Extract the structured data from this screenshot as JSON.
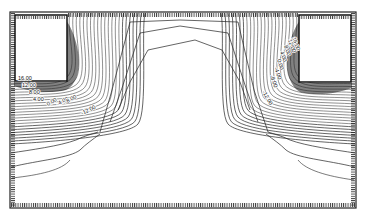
{
  "figure": {
    "type": "contour-plot",
    "frame": {
      "x": 10,
      "y": 12,
      "width": 346,
      "height": 196
    },
    "line_color": "#222222",
    "background": "#ffffff"
  },
  "electrodes": [
    {
      "name": "left-electrode",
      "x": 15,
      "y": 15,
      "width": 52,
      "height": 66
    },
    {
      "name": "right-electrode",
      "x": 299,
      "y": 15,
      "width": 52,
      "height": 67
    }
  ],
  "contour_labels": {
    "left": [
      {
        "text": "16.00",
        "x": 18,
        "y": 80,
        "rotate": 0
      },
      {
        "text": "12.00",
        "x": 22,
        "y": 87,
        "rotate": 0
      },
      {
        "text": "8.00",
        "x": 29,
        "y": 94,
        "rotate": 0
      },
      {
        "text": "4.00",
        "x": 33,
        "y": 101,
        "rotate": 0
      },
      {
        "text": "0.00",
        "x": 48,
        "y": 106,
        "rotate": -30
      },
      {
        "text": "-4.00",
        "x": 58,
        "y": 106,
        "rotate": -30
      },
      {
        "text": "-8.00",
        "x": 66,
        "y": 104,
        "rotate": -30
      },
      {
        "text": "-12.00",
        "x": 82,
        "y": 115,
        "rotate": -25
      }
    ],
    "right": [
      {
        "text": "16.00",
        "x": 292,
        "y": 38,
        "rotate": 70
      },
      {
        "text": "12.00",
        "x": 288,
        "y": 40,
        "rotate": 70
      },
      {
        "text": "8.00",
        "x": 284,
        "y": 46,
        "rotate": 70
      },
      {
        "text": "4.00",
        "x": 280,
        "y": 52,
        "rotate": 70
      },
      {
        "text": "0.00",
        "x": 277,
        "y": 60,
        "rotate": 70
      },
      {
        "text": "-4.00",
        "x": 274,
        "y": 68,
        "rotate": 70
      },
      {
        "text": "-8.00",
        "x": 270,
        "y": 76,
        "rotate": 70
      },
      {
        "text": "-12.00",
        "x": 262,
        "y": 92,
        "rotate": 60
      }
    ]
  },
  "contour_levels": [
    "16.00",
    "12.00",
    "8.00",
    "4.00",
    "0.00",
    "-4.00",
    "-8.00",
    "-12.00"
  ]
}
